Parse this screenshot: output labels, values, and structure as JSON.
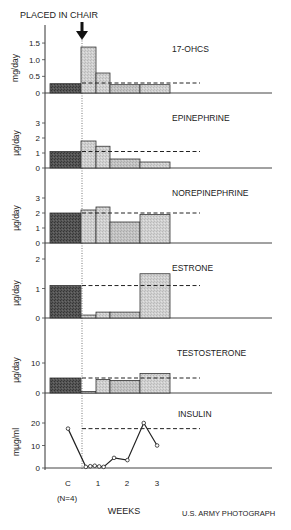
{
  "annotation": {
    "label": "PLACED IN CHAIR",
    "x_pos": 82
  },
  "x_axis": {
    "label": "WEEKS",
    "ticks": [
      "C",
      "1",
      "2",
      "3"
    ],
    "tick_note": "(N=4)"
  },
  "credit": "U.S. ARMY PHOTOGRAPH",
  "colors": {
    "control": "#4a4a4a",
    "post": "#cfcfcf",
    "post_mid": "#bdbdbd",
    "line": "#222222"
  },
  "chart_data": [
    {
      "type": "bar",
      "title": "17-OHCS",
      "ylabel": "mg/day",
      "yticks": [
        0,
        0.5,
        1.0,
        1.5
      ],
      "ytick_labels": [
        "0",
        "0.5",
        "1.0",
        "1.5"
      ],
      "categories": [
        "C",
        "W1a",
        "W1b",
        "W2",
        "W3"
      ],
      "values": [
        0.28,
        1.38,
        0.6,
        0.25,
        0.25
      ],
      "control_mean": 0.3,
      "ylim": [
        0,
        1.8
      ]
    },
    {
      "type": "bar",
      "title": "EPINEPHRINE",
      "ylabel": "µg/day",
      "yticks": [
        0,
        1,
        2,
        3
      ],
      "ytick_labels": [
        "0",
        "1",
        "2",
        "3"
      ],
      "categories": [
        "C",
        "W1a",
        "W1b",
        "W2",
        "W3"
      ],
      "values": [
        1.1,
        1.8,
        1.45,
        0.6,
        0.4
      ],
      "control_mean": 1.1,
      "ylim": [
        0,
        3.5
      ]
    },
    {
      "type": "bar",
      "title": "NOREPINEPHRINE",
      "ylabel": "µg/day",
      "yticks": [
        0,
        1,
        2,
        3
      ],
      "ytick_labels": [
        "0",
        "1",
        "2",
        "3"
      ],
      "categories": [
        "C",
        "W1a",
        "W1b",
        "W2",
        "W3"
      ],
      "values": [
        2.0,
        2.2,
        2.4,
        1.4,
        1.9
      ],
      "control_mean": 2.0,
      "ylim": [
        0,
        3.5
      ]
    },
    {
      "type": "bar",
      "title": "ESTRONE",
      "ylabel": "µg/day",
      "yticks": [
        0,
        1,
        2
      ],
      "ytick_labels": [
        "0",
        "1",
        "2"
      ],
      "categories": [
        "C",
        "W1a",
        "W1b",
        "W2",
        "W3"
      ],
      "values": [
        1.1,
        0.1,
        0.2,
        0.2,
        1.5
      ],
      "control_mean": 1.1,
      "ylim": [
        0,
        2.2
      ]
    },
    {
      "type": "bar",
      "title": "TESTOSTERONE",
      "ylabel": "µg/day",
      "yticks": [
        0,
        10
      ],
      "ytick_labels": [
        "0",
        "10"
      ],
      "categories": [
        "C",
        "W1a",
        "W1b",
        "W2",
        "W3"
      ],
      "values": [
        5.0,
        0.5,
        4.5,
        4.2,
        6.5
      ],
      "control_mean": 5.0,
      "ylim": [
        0,
        20
      ]
    },
    {
      "type": "line",
      "title": "INSULIN",
      "ylabel": "mµg/ml",
      "yticks": [
        0,
        10,
        20
      ],
      "ytick_labels": [
        "0",
        "10",
        "20"
      ],
      "x_weeks": [
        0,
        0.6,
        0.75,
        0.9,
        1.05,
        1.2,
        1.55,
        2.0,
        2.55,
        3.0
      ],
      "values": [
        17.5,
        0.5,
        0.8,
        1.0,
        0.7,
        0.5,
        4.5,
        3.5,
        20,
        10
      ],
      "control_mean": 17.5,
      "ylim": [
        0,
        25
      ]
    }
  ]
}
